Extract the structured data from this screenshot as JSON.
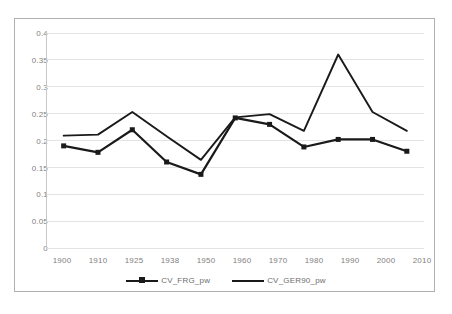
{
  "chart_data": {
    "type": "line",
    "title": "",
    "xlabel": "",
    "ylabel": "",
    "categories": [
      "1900",
      "1910",
      "1925",
      "1938",
      "1950",
      "1960",
      "1970",
      "1980",
      "1990",
      "2000",
      "2010"
    ],
    "tick_labels_x": [
      "1900",
      "1910",
      "1925",
      "1938",
      "1950",
      "1960",
      "1970",
      "1980",
      "1990",
      "2000",
      "2010"
    ],
    "tick_labels_y": [
      "0",
      "0.05",
      "0.1",
      "0.15",
      "0.2",
      "0.25",
      "0.3",
      "0.35",
      "0.4"
    ],
    "ylim": [
      0,
      0.4
    ],
    "ytick_step": 0.05,
    "grid": "horizontal",
    "legend_position": "bottom-center",
    "series": [
      {
        "name": "CV_FRG_pw",
        "marker": "square",
        "color": "#1a1a1a",
        "values": [
          0.19,
          0.178,
          0.22,
          0.16,
          0.137,
          0.242,
          0.23,
          0.188,
          0.202,
          0.202,
          0.18
        ]
      },
      {
        "name": "CV_GER90_pw",
        "marker": "none",
        "color": "#1a1a1a",
        "values": [
          0.209,
          0.211,
          0.253,
          0.208,
          0.164,
          0.243,
          0.249,
          0.218,
          0.36,
          0.253,
          0.218
        ]
      }
    ]
  },
  "legend": {
    "entries": [
      {
        "label": "CV_FRG_pw"
      },
      {
        "label": "CV_GER90_pw"
      }
    ]
  },
  "axis": {
    "y_labels": [
      "0.4",
      "0.35",
      "0.3",
      "0.25",
      "0.2",
      "0.15",
      "0.1",
      "0.05",
      "0"
    ],
    "x_labels": [
      "1900",
      "1910",
      "1925",
      "1938",
      "1950",
      "1960",
      "1970",
      "1980",
      "1990",
      "2000",
      "2010"
    ]
  },
  "colors": {
    "series_line": "#1a1a1a",
    "gridline": "#e3e3e3",
    "axis_line": "#c8c8c8",
    "frame": "#b0b0b0",
    "tick_text": "#808080"
  }
}
